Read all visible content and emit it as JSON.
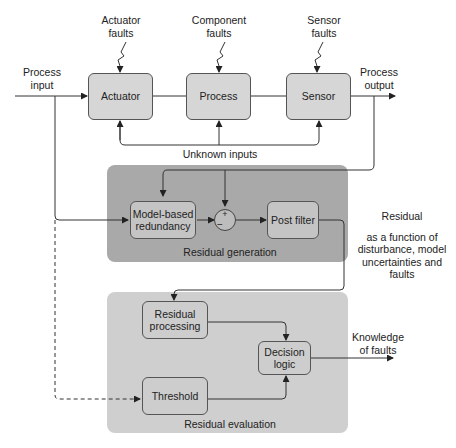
{
  "diagram": {
    "process_input": "Process\ninput",
    "process_output": "Process\noutput",
    "fault_labels": {
      "actuator": [
        "Actuator",
        "faults"
      ],
      "component": [
        "Component",
        "faults"
      ],
      "sensor": [
        "Sensor",
        "faults"
      ]
    },
    "blocks": {
      "actuator": "Actuator",
      "process": "Process",
      "sensor": "Sensor",
      "model_based": [
        "Model-based",
        "redundancy"
      ],
      "post_filter": "Post filter",
      "residual_processing": [
        "Residual",
        "processing"
      ],
      "decision_logic": [
        "Decision",
        "logic"
      ],
      "threshold": "Threshold"
    },
    "unknown_inputs": "Unknown inputs",
    "panels": {
      "generation": "Residual generation",
      "evaluation": "Residual evaluation"
    },
    "sum_junction": {
      "plus": "+",
      "minus": "−"
    },
    "residual_note": {
      "title": "Residual",
      "lines": [
        "as a function of",
        "disturbance, model",
        "uncertainties and",
        "faults"
      ]
    },
    "output_label": [
      "Knowledge",
      "of faults"
    ],
    "colors": {
      "block_fill": "#d6d6d6",
      "generation_panel": "#a9a9a9",
      "evaluation_panel": "#cfcfcf",
      "line": "#333333"
    }
  }
}
